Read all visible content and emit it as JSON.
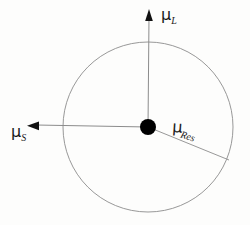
{
  "figure": {
    "title": "",
    "background_color": "#fdfdfc",
    "stroke_color": "#8c8c8c",
    "dot_color": "#000000",
    "label_color": "#1a1a1a",
    "geometry": {
      "center_x": 148,
      "center_y": 127,
      "radius": 85,
      "dot_radius": 8
    },
    "vectors": [
      {
        "id": "mu-l",
        "symbol": "μ",
        "subscript": "L",
        "direction": "up",
        "has_arrowhead": true,
        "tip_x": 149,
        "tip_y": 10,
        "label_x": 161,
        "label_y": 7
      },
      {
        "id": "mu-s",
        "symbol": "μ",
        "subscript": "S",
        "direction": "left",
        "has_arrowhead": true,
        "tip_x": 28,
        "tip_y": 126,
        "label_x": 11,
        "label_y": 124
      },
      {
        "id": "mu-res",
        "symbol": "μ",
        "subscript": "Res",
        "direction": "down-right",
        "has_arrowhead": false,
        "tip_x": 229,
        "tip_y": 160,
        "label_x": 173,
        "label_y": 119
      }
    ]
  }
}
